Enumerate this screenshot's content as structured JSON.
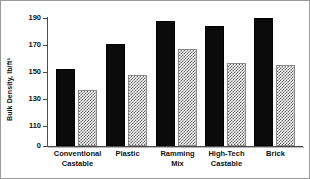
{
  "chart_data": {
    "type": "bar",
    "title": "",
    "xlabel": "",
    "ylabel": "Bulk Density, lb/ft³",
    "categories": [
      "Conventional\nCastable",
      "Plastic",
      "Ramming\nMix",
      "High-Tech\nCastable",
      "Brick"
    ],
    "series": [
      {
        "name": "solid",
        "style": "solid-black",
        "color": "#0b0b0b",
        "values": [
          152,
          171,
          188,
          184,
          190
        ]
      },
      {
        "name": "hatched",
        "style": "checkered-gray",
        "color": "#5f5f5f",
        "values": [
          137,
          148,
          167,
          157,
          155
        ]
      }
    ],
    "ylim": [
      110,
      195
    ],
    "yticks": [
      0,
      110,
      130,
      150,
      170,
      190
    ],
    "ytick_labels": [
      "0",
      "110",
      "130",
      "150",
      "170",
      "190"
    ],
    "axis_break": true,
    "grid": false,
    "legend": "none"
  },
  "axis": {
    "y_title": "Bulk Density, lb/ft³",
    "ticks": [
      {
        "label": "190",
        "y": 17
      },
      {
        "label": "170",
        "y": 44
      },
      {
        "label": "150",
        "y": 71
      },
      {
        "label": "130",
        "y": 98
      },
      {
        "label": "110",
        "y": 125
      },
      {
        "label": "0",
        "y": 145
      }
    ]
  },
  "groups": [
    {
      "label": "Conventional\nCastable",
      "left": 8,
      "width": 43,
      "solid": 152,
      "hatched": 137
    },
    {
      "label": "Plastic",
      "left": 58,
      "width": 43,
      "solid": 171,
      "hatched": 148
    },
    {
      "label": "Ramming\nMix",
      "left": 108,
      "width": 43,
      "solid": 188,
      "hatched": 167
    },
    {
      "label": "High-Tech\nCastable",
      "left": 157,
      "width": 43,
      "solid": 184,
      "hatched": 157
    },
    {
      "label": "Brick",
      "left": 206,
      "width": 43,
      "solid": 190,
      "hatched": 155
    }
  ]
}
